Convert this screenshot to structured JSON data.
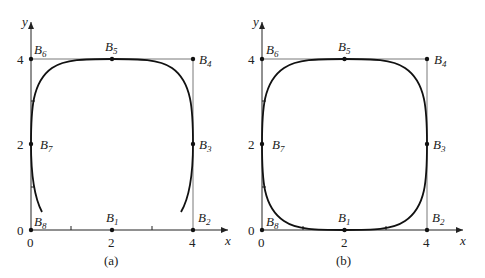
{
  "figure": {
    "panels": [
      {
        "id": "a",
        "caption": "(a)",
        "axes": {
          "xlabel": "x",
          "ylabel": "y",
          "xticks": [
            "0",
            "2",
            "4"
          ],
          "yticks": [
            "0",
            "2",
            "4"
          ]
        },
        "control_points": [
          {
            "name": "B",
            "sub": "1",
            "x": 2,
            "y": 0
          },
          {
            "name": "B",
            "sub": "2",
            "x": 4,
            "y": 0
          },
          {
            "name": "B",
            "sub": "3",
            "x": 4,
            "y": 2
          },
          {
            "name": "B",
            "sub": "4",
            "x": 4,
            "y": 4
          },
          {
            "name": "B",
            "sub": "5",
            "x": 2,
            "y": 4
          },
          {
            "name": "B",
            "sub": "6",
            "x": 0,
            "y": 4
          },
          {
            "name": "B",
            "sub": "7",
            "x": 0,
            "y": 2
          },
          {
            "name": "B",
            "sub": "8",
            "x": 0,
            "y": 0
          }
        ],
        "curve": "open B-spline curve (gap at bottom)"
      },
      {
        "id": "b",
        "caption": "(b)",
        "axes": {
          "xlabel": "x",
          "ylabel": "y",
          "xticks": [
            "0",
            "2",
            "4"
          ],
          "yticks": [
            "0",
            "2",
            "4"
          ]
        },
        "control_points": [
          {
            "name": "B",
            "sub": "1",
            "x": 2,
            "y": 0
          },
          {
            "name": "B",
            "sub": "2",
            "x": 4,
            "y": 0
          },
          {
            "name": "B",
            "sub": "3",
            "x": 4,
            "y": 2
          },
          {
            "name": "B",
            "sub": "4",
            "x": 4,
            "y": 4
          },
          {
            "name": "B",
            "sub": "5",
            "x": 2,
            "y": 4
          },
          {
            "name": "B",
            "sub": "6",
            "x": 0,
            "y": 4
          },
          {
            "name": "B",
            "sub": "7",
            "x": 0,
            "y": 2
          },
          {
            "name": "B",
            "sub": "8",
            "x": 0,
            "y": 0
          }
        ],
        "curve": "closed periodic B-spline curve"
      }
    ]
  }
}
